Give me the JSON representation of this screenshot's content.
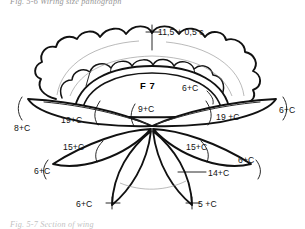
{
  "figure": {
    "caption_top": "Fig. 5-6   Wiring size pantograph",
    "caption_bottom": "Fig. 5-7   Section of wing",
    "center_label": "F 7",
    "colors": {
      "ink": "#111111",
      "hairline": "#8b8b8b",
      "paper": "#ffffff"
    },
    "dimensions": {
      "crown_top": "11,5 + 0,5 c",
      "dome_right": "6+C",
      "center_hub": "9+C",
      "wing_left_inner": "19+C",
      "wing_left_tip": "8+C",
      "wing_right_inner": "19 +C",
      "wing_right_tip": "6+C",
      "petal_left_inner": "15+C",
      "petal_left_tip": "6+C",
      "petal_right_inner": "15+C",
      "petal_right_tip": "6+C",
      "bottom_right_span": "14+C",
      "bottom_right_tip": "5 +C",
      "bottom_left_tip": "6+C"
    }
  }
}
